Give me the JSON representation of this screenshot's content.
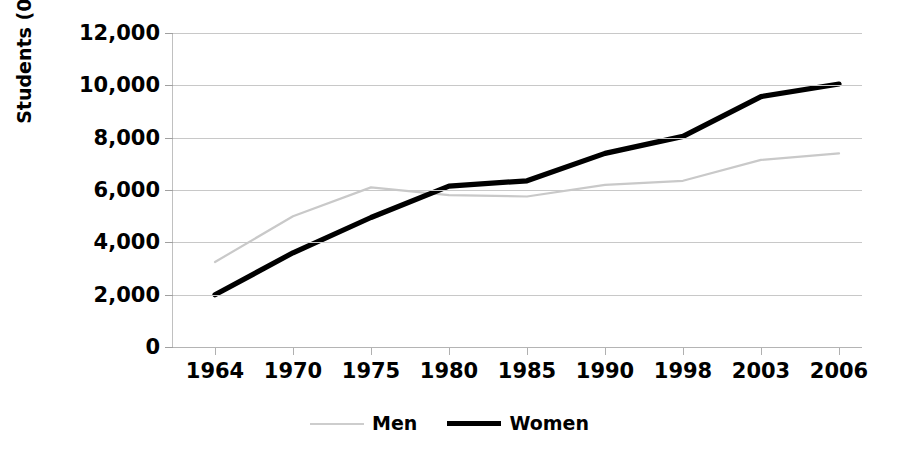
{
  "chart_data": {
    "type": "line",
    "title": "",
    "xlabel": "",
    "ylabel": "Students (000s)",
    "categories": [
      "1964",
      "1970",
      "1975",
      "1980",
      "1985",
      "1990",
      "1998",
      "2003",
      "2006"
    ],
    "ylim": [
      0,
      12000
    ],
    "ytick_labels": [
      "12,000",
      "10,000",
      "8,000",
      "6,000",
      "4,000",
      "2,000",
      "0"
    ],
    "ytick_values": [
      12000,
      10000,
      8000,
      6000,
      4000,
      2000,
      0
    ],
    "grid": true,
    "legend_position": "bottom-center",
    "series": [
      {
        "name": "Men",
        "color": "#cdcdcd",
        "values": [
          3250,
          5000,
          6100,
          5800,
          5750,
          6200,
          6350,
          7150,
          7400
        ]
      },
      {
        "name": "Women",
        "color": "#000000",
        "values": [
          2000,
          3600,
          4950,
          6150,
          6350,
          7400,
          8050,
          9570,
          10050
        ]
      }
    ]
  }
}
